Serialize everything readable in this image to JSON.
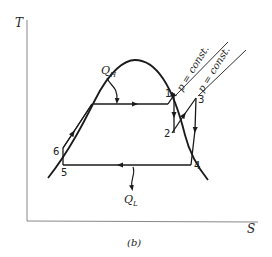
{
  "figure": {
    "caption": "(b)",
    "axes": {
      "y_label": "T",
      "x_label": "S"
    },
    "heat_labels": {
      "high": "Q",
      "high_sub": "H",
      "low": "Q",
      "low_sub": "L"
    },
    "isobar_labels": [
      "p = const.",
      "p = const."
    ],
    "points": [
      {
        "id": "1",
        "label": "1"
      },
      {
        "id": "2",
        "label": "2"
      },
      {
        "id": "3",
        "label": "3"
      },
      {
        "id": "4",
        "label": "4"
      },
      {
        "id": "5",
        "label": "5"
      },
      {
        "id": "6",
        "label": "6"
      }
    ],
    "colors": {
      "ink": "#1a1a1a",
      "axis": "#888888",
      "background": "#ffffff"
    }
  }
}
